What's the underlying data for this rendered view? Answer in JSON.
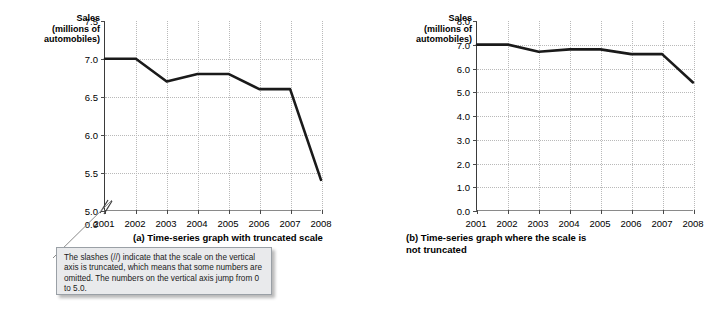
{
  "chart_data": [
    {
      "type": "line",
      "id": "truncated",
      "title": "(a) Time-series graph with truncated scale",
      "ylabel": "Sales\n(millions of\nautomobiles)",
      "xlabel": "",
      "categories": [
        "2001",
        "2002",
        "2003",
        "2004",
        "2005",
        "2006",
        "2007",
        "2008"
      ],
      "values": [
        7.0,
        7.0,
        6.7,
        6.8,
        6.8,
        6.6,
        6.6,
        5.4
      ],
      "series": [
        {
          "name": "Automobile sales",
          "values": [
            7.0,
            7.0,
            6.7,
            6.8,
            6.8,
            6.6,
            6.6,
            5.4
          ]
        }
      ],
      "ytick_labels": [
        "7.5",
        "7.0",
        "6.5",
        "6.0",
        "5.5",
        "5.0",
        "0.0"
      ],
      "ytick_values": [
        7.5,
        7.0,
        6.5,
        6.0,
        5.5,
        5.0,
        0.0
      ],
      "ylim": [
        5.0,
        7.5
      ],
      "axis_truncated": true,
      "truncation_note": "scale jumps from 0.0 to 5.0",
      "grid": true,
      "legend": "none",
      "line_color": "#1a1a1a"
    },
    {
      "type": "line",
      "id": "not-truncated",
      "title": "(b) Time-series graph where the scale is\nnot truncated",
      "ylabel": "Sales\n(millions of\nautomobiles)",
      "xlabel": "",
      "categories": [
        "2001",
        "2002",
        "2003",
        "2004",
        "2005",
        "2006",
        "2007",
        "2008"
      ],
      "values": [
        7.0,
        7.0,
        6.7,
        6.8,
        6.8,
        6.6,
        6.6,
        5.4
      ],
      "series": [
        {
          "name": "Automobile sales",
          "values": [
            7.0,
            7.0,
            6.7,
            6.8,
            6.8,
            6.6,
            6.6,
            5.4
          ]
        }
      ],
      "ytick_labels": [
        "8.0",
        "7.0",
        "6.0",
        "5.0",
        "4.0",
        "3.0",
        "2.0",
        "1.0",
        "0.0"
      ],
      "ytick_values": [
        8.0,
        7.0,
        6.0,
        5.0,
        4.0,
        3.0,
        2.0,
        1.0,
        0.0
      ],
      "ylim": [
        0.0,
        8.0
      ],
      "axis_truncated": false,
      "grid": true,
      "legend": "none",
      "line_color": "#1a1a1a"
    }
  ],
  "panel_a": {
    "axis_title": "Sales\n(millions of\nautomobiles)",
    "caption": "(a) Time-series graph with truncated scale",
    "yticks": [
      "7.5",
      "7.0",
      "6.5",
      "6.0",
      "5.5",
      "5.0",
      "0.0"
    ],
    "xticks": [
      "2001",
      "2002",
      "2003",
      "2004",
      "2005",
      "2006",
      "2007",
      "2008"
    ]
  },
  "panel_b": {
    "axis_title": "Sales\n(millions of\nautomobiles)",
    "caption_line1": "(b) Time-series graph where the scale is",
    "caption_line2": "not truncated",
    "yticks": [
      "8.0",
      "7.0",
      "6.0",
      "5.0",
      "4.0",
      "3.0",
      "2.0",
      "1.0",
      "0.0"
    ],
    "xticks": [
      "2001",
      "2002",
      "2003",
      "2004",
      "2005",
      "2006",
      "2007",
      "2008"
    ]
  },
  "callout": {
    "text": "The slashes (//) indicate that the scale on the vertical axis is truncated, which means that some numbers are omitted.  The numbers on the vertical axis jump from 0 to 5.0."
  },
  "colors": {
    "line": "#1a1a1a",
    "grid": "#b9b9b9",
    "axis": "#4a4a4a",
    "callout_bg": "#e9eaec",
    "callout_border": "#9aa0a6"
  }
}
